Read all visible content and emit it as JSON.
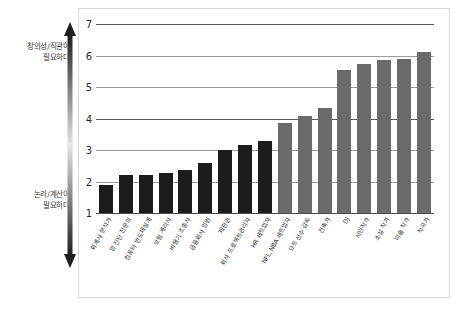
{
  "annotations": {
    "top": "창의성/직관이\n필요하다",
    "bottom": "논리/계산이\n필요하다"
  },
  "colors": {
    "bar_dark": "#1c1c1c",
    "bar_gray": "#6a6a6a",
    "grid": "#9a9a9a",
    "frame": "#d9d9d9"
  },
  "chart_data": {
    "type": "bar",
    "title": "",
    "subtitle": "",
    "xlabel": "",
    "ylabel": "",
    "ylim": [
      1,
      7
    ],
    "yticks": [
      1,
      2,
      3,
      4,
      5,
      6,
      7
    ],
    "grid": true,
    "legend": null,
    "categories": [
      "회계사 분석가",
      "암 진단 전문의",
      "컴퓨터 반도체설계",
      "보험 계리사",
      "비행기 조종사",
      "금융회사 임원",
      "재판관",
      "회사 프로젝트관리자",
      "HR 세트업자",
      "NFL, NBA 세트업자",
      "요트 선수 감독",
      "건축가",
      "DJ",
      "시인작가",
      "소설 작가",
      "미술 작가",
      "작곡가"
    ],
    "values": [
      1.9,
      2.2,
      2.2,
      2.27,
      2.35,
      2.6,
      3.0,
      3.15,
      3.3,
      3.87,
      4.07,
      4.32,
      5.55,
      5.72,
      5.87,
      5.9,
      6.1
    ],
    "bar_colors": [
      "dark",
      "dark",
      "dark",
      "dark",
      "dark",
      "dark",
      "dark",
      "dark",
      "dark",
      "gray",
      "gray",
      "gray",
      "gray",
      "gray",
      "gray",
      "gray",
      "gray"
    ],
    "annotation_axis": {
      "high": "창의성/직관이 필요하다",
      "low": "논리/계산이 필요하다"
    }
  }
}
